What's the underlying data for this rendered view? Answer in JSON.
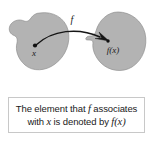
{
  "figure": {
    "type": "function-mapping-diagram",
    "domain_set": {
      "label": "x",
      "name": "domain-blob"
    },
    "codomain_set": {
      "label": "f(x)",
      "name": "codomain-blob"
    },
    "mapping_arrow": {
      "label": "f",
      "description": "curved arrow from x to f(x)"
    },
    "colors": {
      "blob_fill": "#b3b3b3",
      "blob_stroke": "#8f8f8f",
      "arrow": "#151515",
      "background": "#ffffff"
    }
  },
  "caption": {
    "line1_part1": "The element that ",
    "line1_math": "f",
    "line1_part2": " associates",
    "line2_part1": "with ",
    "line2_math1": "x",
    "line2_part2": " is denoted by ",
    "line2_math2": "f(x)",
    "full_text": "The element that f associates with x is denoted by f(x)"
  }
}
